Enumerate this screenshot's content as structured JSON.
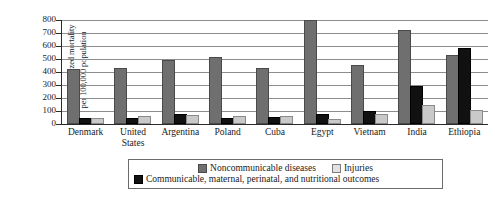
{
  "chart_data": {
    "type": "bar",
    "title": "",
    "xlabel": "",
    "ylabel_line1": "Age-standardized mortality",
    "ylabel_line2": "per 100,000 population",
    "ylim": [
      0,
      800
    ],
    "yticks": [
      0,
      100,
      200,
      300,
      400,
      500,
      600,
      700,
      800
    ],
    "ytick_labels": [
      "0",
      "100",
      "200",
      "300",
      "400",
      "500",
      "600",
      "700",
      "800"
    ],
    "grid": "horizontal",
    "legend_position": "bottom",
    "categories": [
      "Denmark",
      "United States",
      "Argentina",
      "Poland",
      "Cuba",
      "Egypt",
      "Vietnam",
      "India",
      "Ethiopia"
    ],
    "category_labels": [
      "Denmark",
      "United\nStates",
      "Argentina",
      "Poland",
      "Cuba",
      "Egypt",
      "Vietnam",
      "India",
      "Ethiopia"
    ],
    "series": [
      {
        "name": "Noncommunicable diseases",
        "key": "ncd",
        "color": "#6f6f6f",
        "values": [
          408,
          415,
          475,
          500,
          415,
          785,
          435,
          705,
          515
        ]
      },
      {
        "name": "Communicable, maternal, perinatal, and nutritional outcomes",
        "key": "comm",
        "color": "#111111",
        "values": [
          30,
          32,
          65,
          28,
          35,
          65,
          85,
          280,
          570
        ]
      },
      {
        "name": "Injuries",
        "key": "inj",
        "color": "#c9c9c9",
        "values": [
          28,
          48,
          55,
          48,
          45,
          22,
          60,
          130,
          95
        ]
      }
    ]
  },
  "legend": {
    "row1": [
      {
        "label": "Noncommunicable diseases",
        "swatch": "ncd"
      },
      {
        "label": "Injuries",
        "swatch": "inj"
      }
    ],
    "row2": [
      {
        "label": "Communicable, maternal, perinatal, and nutritional outcomes",
        "swatch": "comm"
      }
    ]
  }
}
